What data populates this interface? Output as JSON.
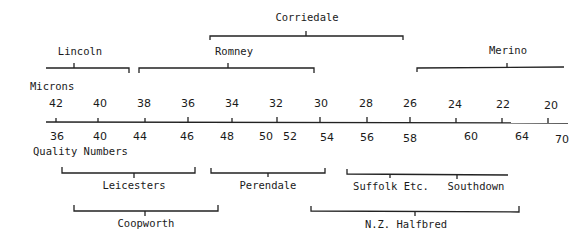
{
  "diagram": {
    "microns_label": "Microns",
    "quality_label": "Quality Numbers",
    "microns": [
      "42",
      "40",
      "38",
      "36",
      "34",
      "32",
      "30",
      "28",
      "26",
      "24",
      "22",
      "20"
    ],
    "quality_numbers": [
      "36",
      "40",
      "44",
      "46",
      "48",
      "50",
      "52",
      "54",
      "56",
      "58",
      "60",
      "64",
      "70"
    ],
    "upper_breeds": [
      {
        "name": "Corriedale"
      },
      {
        "name": "Lincoln"
      },
      {
        "name": "Romney"
      },
      {
        "name": "Merino"
      }
    ],
    "lower_breeds": [
      {
        "name": "Leicesters"
      },
      {
        "name": "Perendale"
      },
      {
        "name": "Suffolk Etc."
      },
      {
        "name": "Southdown"
      },
      {
        "name": "Coopworth"
      },
      {
        "name": "N.Z. Halfbred"
      }
    ]
  }
}
